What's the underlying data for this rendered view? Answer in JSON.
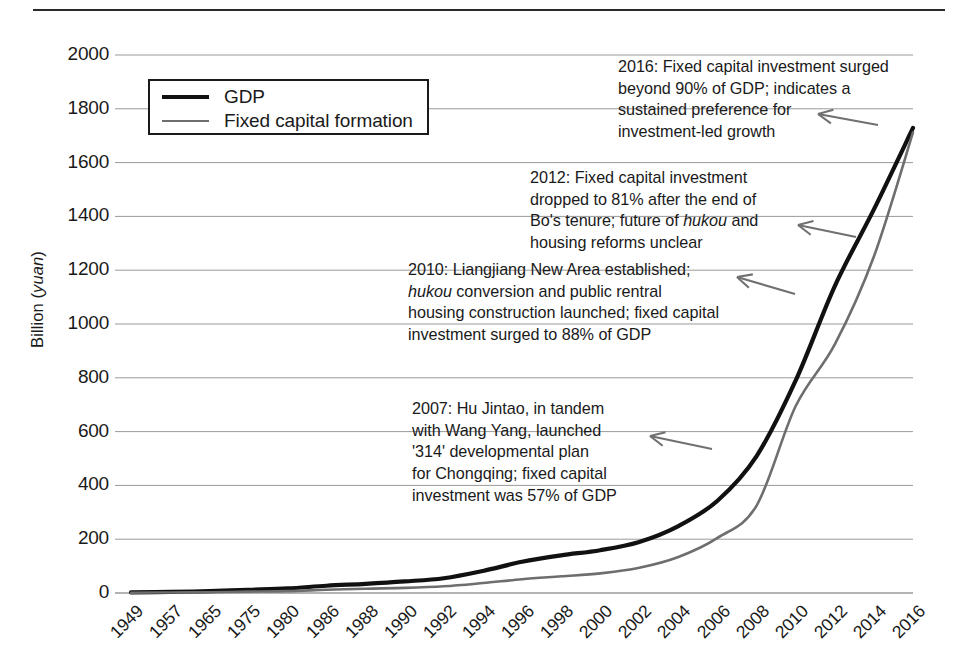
{
  "figure": {
    "background_color": "#ffffff",
    "has_top_rule": true
  },
  "chart_data": {
    "type": "line",
    "title": "",
    "xlabel": "",
    "ylabel": "Billion (yuan)",
    "ylabel_italic_part": "yuan",
    "ylim": [
      0,
      2000
    ],
    "ytick_step": 200,
    "grid": true,
    "grid_color": "#9a9a9a",
    "legend_position": "upper-left-inside",
    "categories": [
      "1949",
      "1957",
      "1965",
      "1975",
      "1980",
      "1986",
      "1988",
      "1990",
      "1992",
      "1994",
      "1996",
      "1998",
      "2000",
      "2002",
      "2004",
      "2006",
      "2008",
      "2010",
      "2012",
      "2014",
      "2016"
    ],
    "yticks": [
      "0",
      "200",
      "400",
      "600",
      "800",
      "1000",
      "1200",
      "1400",
      "1600",
      "1800",
      "2000"
    ],
    "series": [
      {
        "name": "GDP",
        "color": "#111111",
        "width": 4.2,
        "values": [
          2,
          4,
          7,
          12,
          17,
          27,
          34,
          43,
          55,
          82,
          116,
          140,
          159,
          190,
          249,
          343,
          509,
          790,
          1141,
          1426,
          1729
        ]
      },
      {
        "name": "Fixed capital formation",
        "color": "#6e6e6e",
        "width": 2.6,
        "values": [
          1,
          2,
          3,
          5,
          7,
          12,
          16,
          19,
          25,
          37,
          51,
          62,
          73,
          94,
          134,
          205,
          325,
          695,
          924,
          1251,
          1712
        ]
      }
    ],
    "annotations": [
      {
        "id": "annot-2016",
        "text": "2016: Fixed capital investment surged\nbeyond 90% of GDP; indicates a\nsustained preference for\ninvestment-led growth",
        "arrow": {
          "from_x": 878,
          "from_y": 125,
          "to_x": 818,
          "to_y": 114
        }
      },
      {
        "id": "annot-2012",
        "text": "2012: Fixed capital investment\ndropped to 81% after the end of\nBo's tenure; future of hukou and\nhousing reforms unclear",
        "italic_word": "hukou",
        "arrow": {
          "from_x": 856,
          "from_y": 237,
          "to_x": 798,
          "to_y": 225
        }
      },
      {
        "id": "annot-2010",
        "text": "2010: Liangjiang New Area established;\nhukou conversion and public rentral\nhousing construction launched; fixed capital\ninvestment surged to 88% of GDP",
        "italic_word": "hukou",
        "arrow": {
          "from_x": 795,
          "from_y": 294,
          "to_x": 737,
          "to_y": 277
        }
      },
      {
        "id": "annot-2007",
        "text": "2007: Hu Jintao, in tandem\nwith Wang Yang, launched\n'314' developmental plan\nfor Chongqing; fixed capital\ninvestment was 57% of GDP",
        "arrow": {
          "from_x": 712,
          "from_y": 449,
          "to_x": 650,
          "to_y": 436
        }
      }
    ]
  }
}
